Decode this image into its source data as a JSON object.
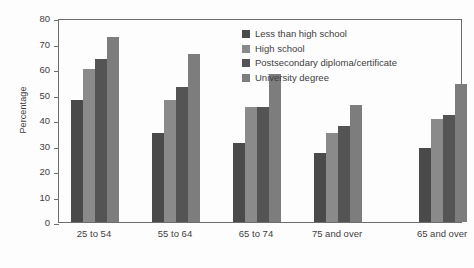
{
  "chart_data": {
    "type": "bar",
    "title": "",
    "xlabel": "",
    "ylabel": "Percentage",
    "ylim": [
      0,
      80
    ],
    "yticks": [
      0,
      10,
      20,
      30,
      40,
      50,
      60,
      70,
      80
    ],
    "grid": false,
    "legend_position": "top-right-inside",
    "categories": [
      "25 to 54",
      "55 to 64",
      "65 to 74",
      "75 and over",
      "65 and over"
    ],
    "series": [
      {
        "name": "Less than high school",
        "color": "#4a4a4a",
        "values": [
          48,
          35,
          31,
          27,
          29
        ]
      },
      {
        "name": "High school",
        "color": "#8a8a8a",
        "values": [
          60,
          48,
          45,
          35,
          40.5
        ]
      },
      {
        "name": "Postsecondary diploma/certificate",
        "color": "#545454",
        "values": [
          64,
          53,
          45,
          37.5,
          42
        ]
      },
      {
        "name": "University degree",
        "color": "#7d7d7d",
        "values": [
          72.5,
          66,
          58,
          46,
          54
        ]
      }
    ]
  }
}
